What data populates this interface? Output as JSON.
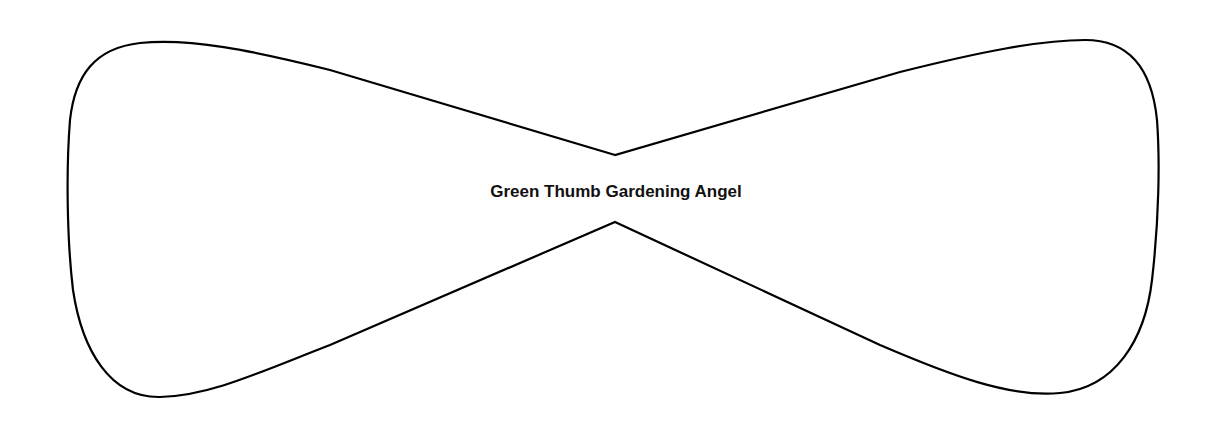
{
  "diagram": {
    "shape": "bow-tie-label-outline",
    "label": "Green Thumb Gardening Angel",
    "stroke_color": "#000000",
    "fill_color": "#ffffff",
    "background_color": "#ffffff"
  }
}
